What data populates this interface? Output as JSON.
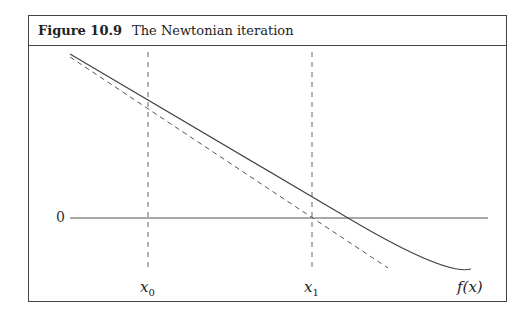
{
  "figure": {
    "label": "Figure 10.9",
    "title": "The Newtonian iteration"
  },
  "axis": {
    "zero_label": "0"
  },
  "labels": {
    "x0": "x",
    "x0_sub": "0",
    "x1": "x",
    "x1_sub": "1",
    "fx": "f(x)"
  },
  "colors": {
    "stroke": "#444444",
    "border": "#444444"
  }
}
